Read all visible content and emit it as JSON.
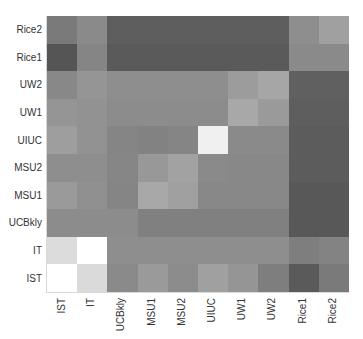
{
  "chart_data": {
    "type": "heatmap",
    "title": "",
    "xlabel": "",
    "ylabel": "",
    "colormap": "grayscale (dark = low, white = high)",
    "x_categories": [
      "IST",
      "IT",
      "UCBkly",
      "MSU1",
      "MSU2",
      "UIUC",
      "UW1",
      "UW2",
      "Rice1",
      "Rice2"
    ],
    "y_categories_top_to_bottom": [
      "Rice2",
      "Rice1",
      "UW2",
      "UW1",
      "UIUC",
      "MSU2",
      "MSU1",
      "UCBkly",
      "IT",
      "IST"
    ],
    "y_categories_bottom_to_top": [
      "IST",
      "IT",
      "UCBkly",
      "MSU1",
      "MSU2",
      "UIUC",
      "UW1",
      "UW2",
      "Rice1",
      "Rice2"
    ],
    "values_note": "Relative intensity 0-1 (1 = white). Rows listed top to bottom as rendered.",
    "values": [
      [
        0.48,
        0.54,
        0.37,
        0.37,
        0.37,
        0.37,
        0.37,
        0.37,
        0.56,
        0.63
      ],
      [
        0.33,
        0.52,
        0.35,
        0.35,
        0.35,
        0.35,
        0.35,
        0.35,
        0.54,
        0.54
      ],
      [
        0.53,
        0.58,
        0.56,
        0.56,
        0.56,
        0.56,
        0.61,
        0.65,
        0.38,
        0.38
      ],
      [
        0.58,
        0.57,
        0.55,
        0.55,
        0.55,
        0.55,
        0.66,
        0.6,
        0.37,
        0.37
      ],
      [
        0.62,
        0.57,
        0.52,
        0.51,
        0.52,
        0.94,
        0.54,
        0.54,
        0.36,
        0.36
      ],
      [
        0.56,
        0.56,
        0.53,
        0.6,
        0.64,
        0.54,
        0.53,
        0.53,
        0.36,
        0.36
      ],
      [
        0.6,
        0.56,
        0.52,
        0.66,
        0.63,
        0.53,
        0.53,
        0.53,
        0.35,
        0.35
      ],
      [
        0.55,
        0.55,
        0.55,
        0.5,
        0.5,
        0.5,
        0.5,
        0.5,
        0.35,
        0.35
      ],
      [
        0.86,
        1.0,
        0.56,
        0.56,
        0.56,
        0.56,
        0.56,
        0.56,
        0.49,
        0.51
      ],
      [
        1.0,
        0.85,
        0.54,
        0.6,
        0.55,
        0.63,
        0.58,
        0.49,
        0.35,
        0.48
      ]
    ],
    "colors": [
      [
        "#7a7a7a",
        "#8a8a8a",
        "#5e5e5e",
        "#5e5e5e",
        "#5e5e5e",
        "#5e5e5e",
        "#5e5e5e",
        "#5e5e5e",
        "#8e8e8e",
        "#a0a0a0"
      ],
      [
        "#555555",
        "#858585",
        "#5a5a5a",
        "#5a5a5a",
        "#5a5a5a",
        "#5a5a5a",
        "#5a5a5a",
        "#5a5a5a",
        "#8a8a8a",
        "#8a8a8a"
      ],
      [
        "#888888",
        "#959595",
        "#8e8e8e",
        "#8e8e8e",
        "#8e8e8e",
        "#8e8e8e",
        "#9c9c9c",
        "#a6a6a6",
        "#606060",
        "#606060"
      ],
      [
        "#959595",
        "#929292",
        "#8c8c8c",
        "#8c8c8c",
        "#8c8c8c",
        "#8c8c8c",
        "#a8a8a8",
        "#9a9a9a",
        "#5e5e5e",
        "#5e5e5e"
      ],
      [
        "#9e9e9e",
        "#929292",
        "#858585",
        "#828282",
        "#858585",
        "#f0f0f0",
        "#8a8a8a",
        "#8a8a8a",
        "#5c5c5c",
        "#5c5c5c"
      ],
      [
        "#8e8e8e",
        "#8e8e8e",
        "#868686",
        "#989898",
        "#a2a2a2",
        "#8a8a8a",
        "#888888",
        "#888888",
        "#5c5c5c",
        "#5c5c5c"
      ],
      [
        "#9a9a9a",
        "#909090",
        "#858585",
        "#a8a8a8",
        "#a0a0a0",
        "#888888",
        "#888888",
        "#888888",
        "#585858",
        "#585858"
      ],
      [
        "#8c8c8c",
        "#8c8c8c",
        "#8c8c8c",
        "#808080",
        "#808080",
        "#808080",
        "#808080",
        "#808080",
        "#585858",
        "#585858"
      ],
      [
        "#dcdcdc",
        "#ffffff",
        "#8e8e8e",
        "#8e8e8e",
        "#8e8e8e",
        "#8e8e8e",
        "#8e8e8e",
        "#8e8e8e",
        "#7e7e7e",
        "#838383"
      ],
      [
        "#ffffff",
        "#dadada",
        "#8a8a8a",
        "#9a9a9a",
        "#8c8c8c",
        "#a0a0a0",
        "#959595",
        "#7e7e7e",
        "#5a5a5a",
        "#7a7a7a"
      ]
    ],
    "grid": false,
    "legend": "none",
    "colorbar": "none"
  }
}
